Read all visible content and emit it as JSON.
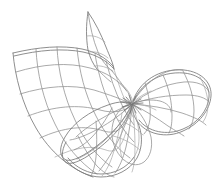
{
  "figure": {
    "kind": "wireframe-surface-diagram",
    "title": "Wireframe mesh of a three-lobed singular surface",
    "background_color": "#ffffff",
    "line_color": "#8d8d8d",
    "line_color_dark": "#6f6f6f",
    "line_color_faint": "#a6a6a6",
    "line_width": 0.75,
    "width": 221,
    "height": 190,
    "has_axes": false,
    "has_labels": false,
    "has_text": false,
    "shading": "none",
    "render_style": "hidden-line-free transparent wireframe"
  },
  "geometry": {
    "singular_point": {
      "x": 132,
      "y": 104
    },
    "bounds": {
      "left": 11,
      "top": 11,
      "right": 213,
      "bottom": 179
    },
    "parts": [
      {
        "name": "upper-left-sheet",
        "role": "broad curved quadrilateral mesh sweeping up and to the left",
        "u_lines": 6,
        "v_lines": 4,
        "corner_hint": {
          "x": 13,
          "y": 53
        }
      },
      {
        "name": "lower-left-sheet",
        "role": "continuation of the sheet curving down toward the bottom lobe",
        "u_lines": 5,
        "v_lines": 4
      },
      {
        "name": "top-spike",
        "role": "narrow pointed fin rising from the sheet at the top",
        "tip": {
          "x": 88,
          "y": 12
        },
        "u_lines": 3,
        "v_lines": 2
      },
      {
        "name": "right-lobe",
        "role": "petal lobe extending to the right from the singular point",
        "tip": {
          "x": 211,
          "y": 96
        },
        "radial_lines": 6,
        "ring_lines": 3
      },
      {
        "name": "bottom-lobe",
        "role": "petal lobe extending downward from the singular point",
        "tip": {
          "x": 101,
          "y": 177
        },
        "radial_lines": 6,
        "ring_lines": 3
      },
      {
        "name": "inner-lobe",
        "role": "small petal folded between the right and bottom lobes",
        "radial_lines": 5,
        "ring_lines": 2
      }
    ]
  }
}
